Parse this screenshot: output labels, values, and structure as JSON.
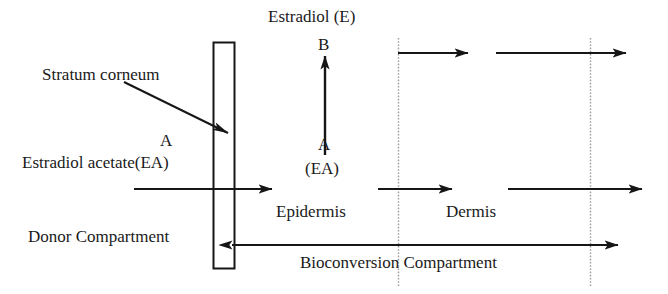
{
  "figure": {
    "title_text": "Estradiol (E)",
    "labels": {
      "estradiol_e": "Estradiol (E)",
      "letter_b": "B",
      "letter_a_center": "A",
      "ea_parenthetical": "(EA)",
      "stratum_corneum": "Stratum corneum",
      "letter_a_left": "A",
      "estradiol_acetate": "Estradiol acetate(EA)",
      "epidermis": "Epidermis",
      "dermis": "Dermis",
      "donor_compartment": "Donor Compartment",
      "bioconversion_compartment": "Bioconversion Compartment"
    },
    "colors": {
      "stroke": "#161616",
      "dotted": "#9a9a9a",
      "text": "#1a1a1a",
      "background": "#ffffff"
    },
    "regions": [
      "Donor Compartment",
      "Stratum corneum",
      "Epidermis",
      "Dermis"
    ],
    "species": [
      {
        "code": "A",
        "name": "Estradiol acetate(EA)"
      },
      {
        "code": "B",
        "name": "Estradiol (E)"
      }
    ],
    "reaction": "A (EA) converts to B (E)"
  }
}
